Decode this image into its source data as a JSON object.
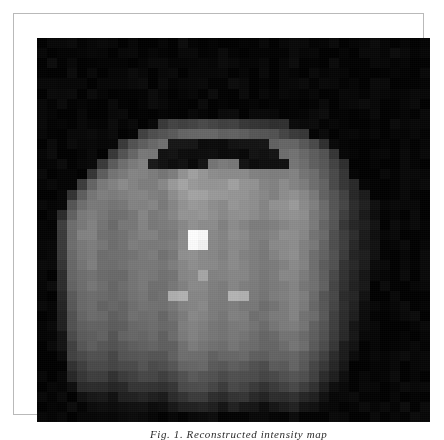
{
  "figure": {
    "kind": "grayscale-pixel-map",
    "frame_color": "#b9b9b9",
    "page_background": "#ffffff",
    "canvas_background": "#070707",
    "caption_partial": "Fig. 1. Reconstructed intensity map"
  },
  "chart_data": {
    "type": "heatmap",
    "title": "",
    "subtitle": "",
    "xlabel": "",
    "ylabel": "",
    "colormap": "gray",
    "grid": false,
    "legend": null,
    "cell_px": 10,
    "cols": 39,
    "rows": 38,
    "vmin": 0,
    "vmax": 255,
    "xticklabels": [],
    "yticklabels": [],
    "annotations": [
      {
        "label": "peak",
        "col": 19,
        "row": 16,
        "value": 252
      }
    ],
    "values": [
      [
        4,
        5,
        3,
        6,
        4,
        3,
        5,
        4,
        3,
        6,
        4,
        3,
        5,
        4,
        6,
        3,
        4,
        5,
        3,
        4,
        6,
        3,
        5,
        4,
        3,
        6,
        4,
        3,
        5,
        4,
        3,
        6,
        4,
        5,
        3,
        4,
        6,
        3,
        5
      ],
      [
        5,
        3,
        6,
        4,
        3,
        5,
        6,
        3,
        4,
        5,
        3,
        6,
        4,
        3,
        5,
        4,
        6,
        3,
        5,
        4,
        3,
        6,
        4,
        5,
        3,
        4,
        6,
        3,
        5,
        4,
        6,
        3,
        4,
        5,
        3,
        6,
        4,
        3,
        5
      ],
      [
        3,
        6,
        4,
        5,
        3,
        4,
        6,
        3,
        5,
        4,
        3,
        6,
        4,
        5,
        3,
        6,
        4,
        3,
        5,
        4,
        6,
        3,
        4,
        5,
        3,
        6,
        4,
        3,
        5,
        6,
        3,
        4,
        5,
        3,
        6,
        4,
        3,
        5,
        4
      ],
      [
        4,
        3,
        5,
        6,
        3,
        4,
        5,
        3,
        6,
        4,
        5,
        3,
        6,
        4,
        3,
        5,
        4,
        6,
        3,
        5,
        4,
        3,
        6,
        4,
        5,
        3,
        4,
        6,
        3,
        5,
        4,
        3,
        6,
        4,
        3,
        5,
        6,
        3,
        4
      ],
      [
        6,
        4,
        3,
        5,
        4,
        3,
        6,
        5,
        3,
        4,
        6,
        3,
        5,
        4,
        6,
        3,
        4,
        5,
        3,
        6,
        4,
        3,
        5,
        4,
        6,
        3,
        5,
        4,
        3,
        6,
        4,
        5,
        3,
        4,
        6,
        3,
        5,
        4,
        3
      ],
      [
        3,
        5,
        4,
        6,
        3,
        5,
        4,
        3,
        6,
        4,
        3,
        5,
        6,
        4,
        3,
        5,
        4,
        6,
        3,
        4,
        5,
        3,
        6,
        4,
        3,
        5,
        6,
        3,
        4,
        5,
        3,
        6,
        4,
        3,
        5,
        4,
        6,
        3,
        5
      ],
      [
        5,
        3,
        6,
        4,
        5,
        3,
        4,
        6,
        3,
        5,
        4,
        6,
        3,
        5,
        4,
        3,
        6,
        4,
        5,
        3,
        6,
        4,
        3,
        5,
        4,
        6,
        3,
        5,
        4,
        3,
        6,
        4,
        5,
        3,
        6,
        4,
        3,
        5,
        4
      ],
      [
        4,
        6,
        3,
        5,
        3,
        6,
        4,
        3,
        5,
        4,
        6,
        3,
        4,
        5,
        3,
        6,
        4,
        3,
        5,
        6,
        3,
        4,
        5,
        3,
        6,
        4,
        5,
        3,
        6,
        4,
        3,
        5,
        4,
        6,
        3,
        5,
        4,
        3,
        6
      ],
      [
        3,
        4,
        5,
        3,
        6,
        4,
        3,
        5,
        4,
        6,
        3,
        5,
        58,
        62,
        66,
        70,
        74,
        72,
        68,
        64,
        60,
        56,
        52,
        48,
        44,
        6,
        3,
        5,
        4,
        3,
        6,
        4,
        5,
        3,
        4,
        6,
        3,
        5,
        4
      ],
      [
        6,
        3,
        4,
        5,
        3,
        6,
        4,
        5,
        3,
        4,
        60,
        74,
        86,
        92,
        96,
        100,
        104,
        102,
        98,
        94,
        90,
        86,
        82,
        78,
        70,
        62,
        50,
        4,
        6,
        3,
        5,
        4,
        3,
        6,
        4,
        3,
        5,
        6,
        3
      ],
      [
        4,
        5,
        3,
        6,
        4,
        3,
        5,
        4,
        62,
        80,
        96,
        108,
        112,
        20,
        18,
        16,
        14,
        12,
        14,
        16,
        18,
        20,
        22,
        96,
        104,
        98,
        88,
        70,
        52,
        6,
        3,
        5,
        4,
        6,
        3,
        4,
        5,
        3,
        6
      ],
      [
        3,
        6,
        4,
        5,
        3,
        6,
        4,
        58,
        86,
        104,
        116,
        120,
        18,
        14,
        12,
        10,
        12,
        14,
        12,
        10,
        12,
        14,
        16,
        18,
        108,
        112,
        104,
        92,
        78,
        56,
        4,
        6,
        3,
        5,
        4,
        3,
        6,
        4,
        5
      ],
      [
        5,
        3,
        6,
        4,
        5,
        3,
        60,
        92,
        112,
        122,
        126,
        20,
        16,
        12,
        14,
        12,
        16,
        118,
        126,
        120,
        14,
        12,
        16,
        14,
        20,
        118,
        110,
        98,
        84,
        64,
        48,
        3,
        5,
        4,
        6,
        3,
        4,
        5,
        3
      ],
      [
        4,
        5,
        3,
        6,
        3,
        56,
        96,
        118,
        126,
        130,
        132,
        128,
        122,
        126,
        150,
        156,
        148,
        140,
        136,
        142,
        138,
        132,
        128,
        124,
        130,
        126,
        118,
        106,
        90,
        70,
        52,
        6,
        3,
        5,
        4,
        6,
        3,
        4,
        5
      ],
      [
        3,
        4,
        6,
        3,
        58,
        100,
        122,
        132,
        138,
        134,
        130,
        128,
        134,
        152,
        160,
        156,
        150,
        146,
        152,
        158,
        150,
        144,
        138,
        134,
        140,
        136,
        128,
        114,
        96,
        76,
        56,
        40,
        6,
        4,
        3,
        5,
        4,
        3,
        6
      ],
      [
        6,
        3,
        5,
        50,
        92,
        118,
        130,
        128,
        124,
        130,
        136,
        132,
        128,
        140,
        158,
        164,
        160,
        154,
        148,
        152,
        146,
        140,
        136,
        132,
        138,
        142,
        134,
        120,
        102,
        82,
        60,
        44,
        30,
        5,
        4,
        3,
        6,
        4,
        3
      ],
      [
        4,
        6,
        3,
        84,
        114,
        126,
        120,
        116,
        122,
        128,
        134,
        130,
        126,
        134,
        150,
        156,
        152,
        146,
        142,
        148,
        144,
        138,
        134,
        140,
        146,
        150,
        140,
        126,
        108,
        86,
        64,
        46,
        32,
        18,
        3,
        5,
        4,
        6,
        3
      ],
      [
        3,
        5,
        46,
        100,
        122,
        128,
        118,
        112,
        118,
        124,
        130,
        126,
        122,
        130,
        146,
        152,
        148,
        144,
        140,
        146,
        142,
        136,
        132,
        138,
        144,
        148,
        138,
        124,
        106,
        84,
        62,
        44,
        30,
        16,
        5,
        4,
        3,
        5,
        4
      ],
      [
        5,
        4,
        58,
        108,
        126,
        130,
        116,
        110,
        116,
        122,
        128,
        124,
        120,
        126,
        140,
        146,
        142,
        138,
        134,
        140,
        136,
        130,
        126,
        132,
        138,
        142,
        132,
        118,
        100,
        80,
        58,
        42,
        28,
        14,
        4,
        6,
        3,
        4,
        5
      ],
      [
        4,
        3,
        62,
        112,
        128,
        132,
        118,
        112,
        118,
        124,
        130,
        126,
        122,
        128,
        142,
        252,
        250,
        140,
        136,
        142,
        138,
        132,
        128,
        134,
        140,
        144,
        134,
        120,
        102,
        82,
        60,
        44,
        30,
        16,
        6,
        3,
        5,
        4,
        3
      ],
      [
        6,
        4,
        60,
        110,
        126,
        130,
        116,
        110,
        116,
        122,
        128,
        124,
        120,
        126,
        140,
        248,
        246,
        138,
        134,
        140,
        136,
        130,
        126,
        132,
        138,
        142,
        132,
        118,
        100,
        80,
        58,
        42,
        28,
        14,
        3,
        5,
        4,
        3,
        6
      ],
      [
        3,
        5,
        56,
        106,
        122,
        126,
        114,
        108,
        114,
        120,
        126,
        122,
        118,
        124,
        138,
        144,
        140,
        136,
        132,
        138,
        134,
        128,
        124,
        130,
        136,
        140,
        130,
        116,
        98,
        78,
        56,
        40,
        26,
        12,
        4,
        3,
        6,
        4,
        5
      ],
      [
        4,
        3,
        52,
        102,
        118,
        124,
        112,
        106,
        112,
        118,
        124,
        120,
        116,
        122,
        136,
        142,
        138,
        134,
        130,
        136,
        132,
        126,
        122,
        128,
        134,
        138,
        128,
        114,
        96,
        76,
        54,
        38,
        24,
        10,
        5,
        4,
        3,
        5,
        4
      ],
      [
        5,
        4,
        48,
        98,
        114,
        120,
        110,
        104,
        110,
        116,
        122,
        118,
        114,
        120,
        134,
        140,
        170,
        132,
        128,
        134,
        130,
        124,
        120,
        126,
        132,
        136,
        126,
        112,
        94,
        74,
        52,
        36,
        22,
        6,
        3,
        6,
        4,
        3,
        5
      ],
      [
        3,
        6,
        44,
        94,
        110,
        116,
        108,
        102,
        108,
        114,
        120,
        116,
        112,
        118,
        132,
        138,
        136,
        130,
        126,
        132,
        128,
        122,
        118,
        124,
        130,
        134,
        124,
        110,
        92,
        72,
        50,
        34,
        20,
        4,
        6,
        3,
        5,
        4,
        3
      ],
      [
        6,
        3,
        40,
        90,
        106,
        112,
        106,
        100,
        106,
        112,
        118,
        114,
        110,
        178,
        176,
        134,
        132,
        128,
        124,
        176,
        174,
        120,
        116,
        122,
        128,
        132,
        122,
        108,
        90,
        70,
        48,
        32,
        18,
        5,
        4,
        6,
        3,
        5,
        4
      ],
      [
        4,
        5,
        36,
        86,
        102,
        108,
        104,
        98,
        104,
        110,
        116,
        112,
        108,
        116,
        130,
        136,
        134,
        126,
        122,
        130,
        126,
        118,
        114,
        120,
        126,
        130,
        120,
        106,
        88,
        68,
        46,
        30,
        16,
        3,
        5,
        4,
        6,
        3,
        5
      ],
      [
        3,
        4,
        32,
        82,
        98,
        104,
        102,
        96,
        102,
        108,
        114,
        110,
        106,
        114,
        128,
        134,
        132,
        124,
        120,
        128,
        124,
        116,
        112,
        118,
        124,
        128,
        118,
        104,
        86,
        66,
        44,
        28,
        14,
        4,
        3,
        5,
        4,
        6,
        3
      ],
      [
        5,
        3,
        28,
        78,
        94,
        100,
        98,
        92,
        98,
        104,
        110,
        106,
        102,
        110,
        124,
        130,
        128,
        120,
        116,
        124,
        120,
        112,
        108,
        114,
        120,
        124,
        114,
        100,
        82,
        62,
        40,
        24,
        10,
        6,
        4,
        3,
        5,
        3,
        6
      ],
      [
        4,
        6,
        24,
        74,
        90,
        96,
        94,
        88,
        94,
        100,
        106,
        102,
        98,
        106,
        120,
        126,
        124,
        116,
        112,
        120,
        116,
        108,
        104,
        110,
        116,
        120,
        110,
        96,
        78,
        58,
        36,
        20,
        6,
        3,
        5,
        4,
        3,
        6,
        4
      ],
      [
        6,
        3,
        18,
        68,
        84,
        90,
        88,
        82,
        88,
        94,
        100,
        96,
        92,
        100,
        114,
        120,
        118,
        110,
        106,
        114,
        110,
        102,
        98,
        104,
        110,
        114,
        104,
        90,
        72,
        52,
        30,
        14,
        4,
        5,
        3,
        6,
        4,
        3,
        5
      ],
      [
        3,
        5,
        12,
        60,
        76,
        82,
        80,
        74,
        80,
        86,
        92,
        88,
        84,
        92,
        106,
        112,
        110,
        102,
        98,
        106,
        102,
        94,
        90,
        96,
        102,
        106,
        96,
        82,
        64,
        44,
        24,
        8,
        5,
        3,
        6,
        4,
        5,
        3,
        4
      ],
      [
        4,
        3,
        6,
        50,
        66,
        72,
        70,
        64,
        70,
        76,
        82,
        78,
        74,
        82,
        96,
        102,
        100,
        92,
        88,
        96,
        92,
        84,
        80,
        86,
        92,
        96,
        86,
        72,
        54,
        34,
        16,
        4,
        3,
        6,
        4,
        3,
        5,
        4,
        6
      ],
      [
        5,
        4,
        3,
        36,
        54,
        60,
        58,
        52,
        58,
        64,
        70,
        66,
        62,
        70,
        84,
        90,
        88,
        80,
        76,
        84,
        80,
        72,
        68,
        74,
        80,
        84,
        74,
        60,
        42,
        24,
        8,
        6,
        4,
        3,
        5,
        6,
        3,
        4,
        5
      ],
      [
        3,
        6,
        4,
        18,
        38,
        44,
        42,
        38,
        44,
        50,
        56,
        52,
        48,
        56,
        70,
        76,
        74,
        66,
        62,
        70,
        66,
        58,
        54,
        60,
        66,
        70,
        60,
        46,
        30,
        14,
        5,
        3,
        6,
        4,
        3,
        4,
        6,
        3,
        5
      ],
      [
        6,
        3,
        5,
        6,
        20,
        26,
        24,
        20,
        26,
        32,
        38,
        34,
        30,
        38,
        52,
        58,
        56,
        48,
        44,
        52,
        48,
        40,
        36,
        42,
        48,
        52,
        42,
        30,
        16,
        6,
        4,
        5,
        3,
        6,
        4,
        3,
        5,
        4,
        3
      ],
      [
        4,
        5,
        3,
        6,
        4,
        8,
        10,
        8,
        10,
        14,
        18,
        16,
        14,
        18,
        28,
        34,
        32,
        26,
        22,
        28,
        24,
        18,
        16,
        20,
        24,
        28,
        20,
        12,
        6,
        4,
        3,
        6,
        4,
        3,
        5,
        4,
        6,
        3,
        5
      ],
      [
        3,
        4,
        6,
        3,
        5,
        4,
        3,
        5,
        4,
        6,
        5,
        4,
        3,
        5,
        6,
        8,
        10,
        8,
        6,
        8,
        7,
        5,
        4,
        6,
        7,
        8,
        6,
        4,
        3,
        5,
        4,
        3,
        6,
        4,
        3,
        5,
        4,
        6,
        3
      ]
    ]
  }
}
